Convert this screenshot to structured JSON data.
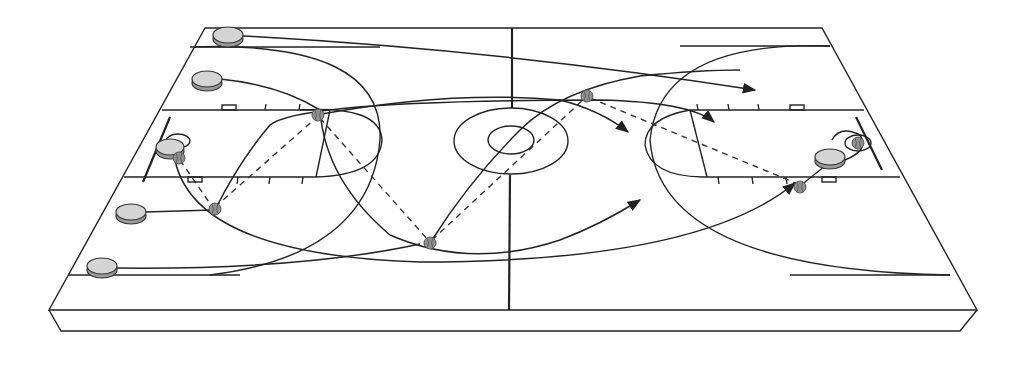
{
  "diagram": {
    "title": "Basketball fast-break play diagram",
    "kind": "court-play-diagram",
    "court": {
      "view": "isometric full court",
      "colors": {
        "line": "#222222",
        "player_fill": "#d4d4d4",
        "ball_fill": "#8f8f8f",
        "background": "#ffffff"
      }
    },
    "players": [
      {
        "id": "p1",
        "label": "Player 1",
        "position": "top-left baseline corner"
      },
      {
        "id": "p2",
        "label": "Player 2",
        "position": "left wing upper"
      },
      {
        "id": "p3",
        "label": "Player 3",
        "position": "left under basket"
      },
      {
        "id": "p4",
        "label": "Player 4",
        "position": "left wing lower"
      },
      {
        "id": "p5",
        "label": "Player 5",
        "position": "bottom-left corner"
      },
      {
        "id": "p6",
        "label": "Player (finish)",
        "position": "right under basket"
      }
    ],
    "balls": [
      {
        "id": "b1",
        "label": "Ball at rebound"
      },
      {
        "id": "b2",
        "label": "Ball outlet lower wing"
      },
      {
        "id": "b3",
        "label": "Ball upper elbow"
      },
      {
        "id": "b4",
        "label": "Ball midcourt low"
      },
      {
        "id": "b5",
        "label": "Ball right wing"
      },
      {
        "id": "b6",
        "label": "Ball right block"
      },
      {
        "id": "b7",
        "label": "Ball at basket (score)"
      }
    ],
    "legend": {
      "solid_arrow": "player movement",
      "dashed_line": "pass"
    }
  }
}
